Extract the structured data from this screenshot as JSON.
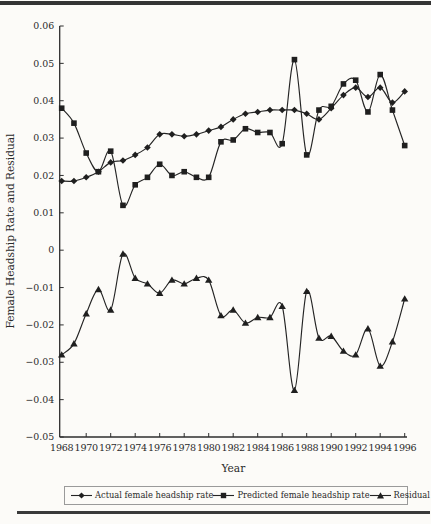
{
  "chart_data": {
    "type": "line",
    "title": "",
    "xlabel": "Year",
    "ylabel": "Female Headship Rate and Residual",
    "x": [
      1968,
      1969,
      1970,
      1971,
      1972,
      1973,
      1974,
      1975,
      1976,
      1977,
      1978,
      1979,
      1980,
      1981,
      1982,
      1983,
      1984,
      1985,
      1986,
      1987,
      1988,
      1989,
      1990,
      1991,
      1992,
      1993,
      1994,
      1995,
      1996
    ],
    "x_tick_labels": [
      "1968",
      "1970",
      "1972",
      "1974",
      "1976",
      "1978",
      "1980",
      "1982",
      "1984",
      "1986",
      "1988",
      "1990",
      "1992",
      "1994",
      "1996"
    ],
    "y_ticks": [
      0.06,
      0.05,
      0.04,
      0.03,
      0.02,
      0.01,
      0,
      -0.01,
      -0.02,
      -0.03,
      -0.04,
      -0.05
    ],
    "y_tick_labels": [
      "0.06",
      "0.05",
      "0.04",
      "0.03",
      "0.02",
      "0.01",
      "0",
      "−0.01",
      "−0.02",
      "−0.03",
      "−0.04",
      "−0.05"
    ],
    "ylim": [
      -0.05,
      0.06
    ],
    "grid": false,
    "legend_position": "bottom",
    "ink_color": "#242424",
    "background_color": "#fcfbf8",
    "series": [
      {
        "id": "actual",
        "name": "Actual female headship rate",
        "marker": "diamond",
        "values": [
          0.0185,
          0.0185,
          0.0195,
          0.021,
          0.0235,
          0.024,
          0.0255,
          0.0275,
          0.031,
          0.031,
          0.0305,
          0.031,
          0.032,
          0.033,
          0.035,
          0.0365,
          0.037,
          0.0375,
          0.0375,
          0.0375,
          0.0365,
          0.035,
          0.038,
          0.0415,
          0.0435,
          0.041,
          0.0435,
          0.0395,
          0.0425
        ]
      },
      {
        "id": "predicted",
        "name": "Predicted female headship rate",
        "marker": "square",
        "values": [
          0.038,
          0.034,
          0.026,
          0.021,
          0.0265,
          0.012,
          0.0175,
          0.0195,
          0.023,
          0.02,
          0.021,
          0.0195,
          0.0195,
          0.029,
          0.0295,
          0.0325,
          0.0315,
          0.0315,
          0.0285,
          0.051,
          0.0255,
          0.0375,
          0.0385,
          0.0445,
          0.0455,
          0.037,
          0.047,
          0.0375,
          0.028
        ]
      },
      {
        "id": "residual",
        "name": "Residual",
        "marker": "triangle",
        "values": [
          -0.028,
          -0.025,
          -0.017,
          -0.0105,
          -0.016,
          -0.001,
          -0.0075,
          -0.009,
          -0.0115,
          -0.008,
          -0.009,
          -0.0075,
          -0.008,
          -0.0175,
          -0.016,
          -0.0195,
          -0.018,
          -0.018,
          -0.015,
          -0.0375,
          -0.011,
          -0.0235,
          -0.023,
          -0.027,
          -0.028,
          -0.021,
          -0.031,
          -0.0245,
          -0.013
        ]
      }
    ]
  }
}
